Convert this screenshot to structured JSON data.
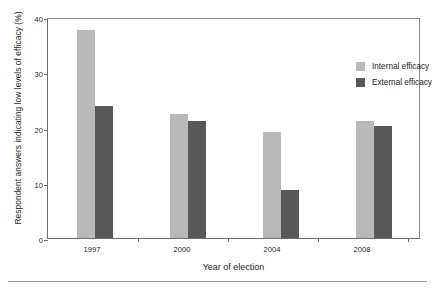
{
  "chart_data": {
    "type": "bar",
    "title": "",
    "xlabel": "Year of election",
    "ylabel": "Respondent answers indicating low levels of efficacy (%)",
    "categories": [
      "1997",
      "2000",
      "2004",
      "2008"
    ],
    "series": [
      {
        "name": "Internal efficacy",
        "color": "#b9b9b9",
        "values": [
          37.7,
          22.4,
          19.2,
          21.2
        ]
      },
      {
        "name": "External efficacy",
        "color": "#585858",
        "values": [
          23.9,
          21.2,
          8.7,
          20.3
        ]
      }
    ],
    "ylim": [
      0,
      40
    ],
    "yticks": [
      0,
      10,
      20,
      30,
      40
    ],
    "ytick_labels": [
      "0",
      "10",
      "20",
      "30",
      "40"
    ],
    "grid": false,
    "legend_position": "top-right"
  },
  "axis": {
    "y_ticks": [
      "40",
      "30",
      "20",
      "10",
      "0"
    ],
    "x_ticks": [
      "1997",
      "2000",
      "2004",
      "2008"
    ],
    "y_title": "Respondent answers indicating low levels of efficacy (%)",
    "x_title": "Year of election"
  },
  "legend": {
    "items": [
      {
        "label": "Internal efficacy",
        "swatch": "internal"
      },
      {
        "label": "External efficacy",
        "swatch": "external"
      }
    ]
  }
}
